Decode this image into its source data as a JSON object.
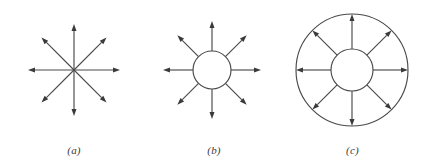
{
  "figure": {
    "background_color": "#ffffff",
    "stroke_color": "#4a4a4a",
    "arrowhead_color": "#3a3a3a",
    "caption_color": "#3b3b3b"
  },
  "panels": [
    {
      "id": "a",
      "caption": "(a)",
      "description": "eight arrows radiating from a single point",
      "arrow_count": 8,
      "arrow_angles_deg": [
        0,
        45,
        90,
        135,
        180,
        225,
        270,
        315
      ],
      "center": {
        "x": 74,
        "y": 70
      },
      "inner_radius": 0,
      "arrow_tip_radius": 46,
      "has_inner_circle": false,
      "has_outer_circle": false
    },
    {
      "id": "b",
      "caption": "(b)",
      "description": "eight arrows radiating outward from the edge of a circle",
      "arrow_count": 8,
      "arrow_angles_deg": [
        0,
        45,
        90,
        135,
        180,
        225,
        270,
        315
      ],
      "center": {
        "x": 64,
        "y": 70
      },
      "inner_radius": 19,
      "arrow_tip_radius": 49,
      "has_inner_circle": true,
      "has_outer_circle": false
    },
    {
      "id": "c",
      "caption": "(c)",
      "description": "eight arrows from an inner circle to a surrounding outer circle",
      "arrow_count": 8,
      "arrow_angles_deg": [
        0,
        45,
        90,
        135,
        180,
        225,
        270,
        315
      ],
      "center": {
        "x": 72,
        "y": 70
      },
      "inner_radius": 21,
      "arrow_tip_radius": 56,
      "outer_radius": 56,
      "has_inner_circle": true,
      "has_outer_circle": true
    }
  ]
}
